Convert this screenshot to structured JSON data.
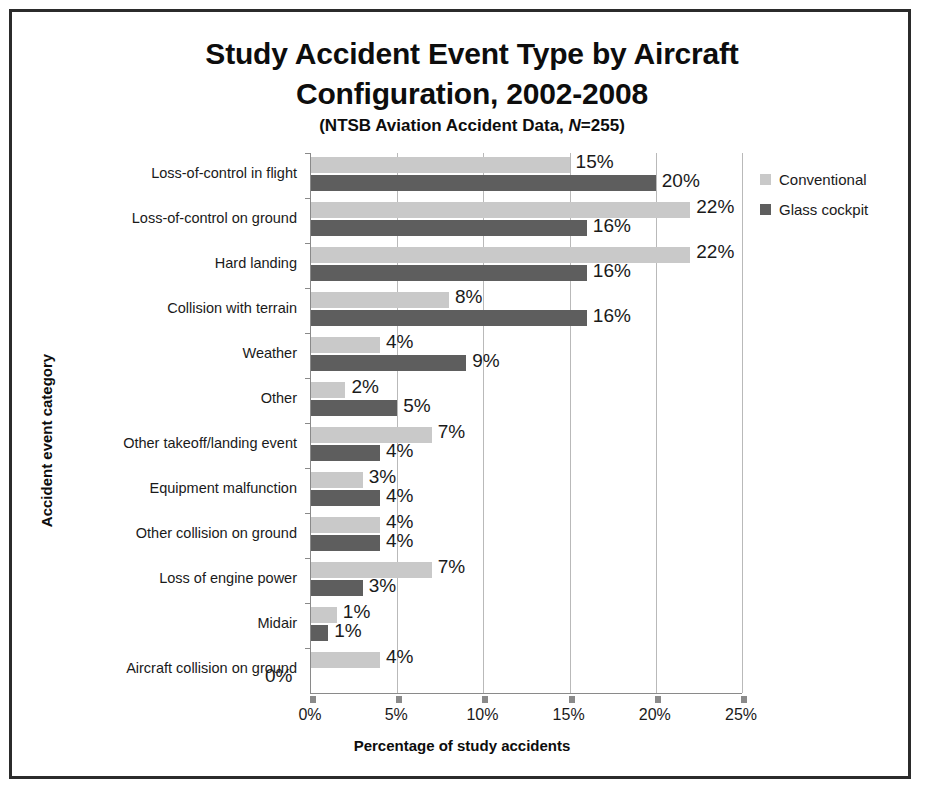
{
  "chart_data": {
    "type": "bar",
    "orientation": "horizontal",
    "title": "Study Accident Event Type by Aircraft Configuration, 2002-2008",
    "title_line1": "Study Accident Event Type by Aircraft",
    "title_line2": "Configuration, 2002-2008",
    "subtitle_prefix": "(NTSB Aviation Accident Data, ",
    "subtitle_italic": "N",
    "subtitle_suffix": "=255)",
    "xlabel": "Percentage of study accidents",
    "ylabel": "Accident event category",
    "xlim": [
      0,
      25
    ],
    "xticks": [
      0,
      5,
      10,
      15,
      20,
      25
    ],
    "xtick_labels": [
      "0%",
      "5%",
      "10%",
      "15%",
      "20%",
      "25%"
    ],
    "grid": true,
    "legend_position": "right",
    "categories": [
      "Loss-of-control in flight",
      "Loss-of-control on ground",
      "Hard landing",
      "Collision with terrain",
      "Weather",
      "Other",
      "Other takeoff/landing event",
      "Equipment malfunction",
      "Other collision on ground",
      "Loss of engine power",
      "Midair",
      "Aircraft collision on ground"
    ],
    "series": [
      {
        "name": "Conventional",
        "color": "#c9c9c9",
        "values": [
          15,
          22,
          22,
          8,
          4,
          2,
          7,
          3,
          4,
          7,
          1.5,
          4
        ],
        "labels": [
          "15%",
          "22%",
          "22%",
          "8%",
          "4%",
          "2%",
          "7%",
          "3%",
          "4%",
          "7%",
          "1%",
          "4%"
        ]
      },
      {
        "name": "Glass cockpit",
        "color": "#5e5e5e",
        "values": [
          20,
          16,
          16,
          16,
          9,
          5,
          4,
          4,
          4,
          3,
          1,
          0
        ],
        "labels": [
          "20%",
          "16%",
          "16%",
          "16%",
          "9%",
          "5%",
          "4%",
          "4%",
          "4%",
          "3%",
          "1%",
          "0%"
        ]
      }
    ]
  },
  "legend": {
    "items": [
      {
        "label": "Conventional"
      },
      {
        "label": "Glass cockpit"
      }
    ]
  }
}
